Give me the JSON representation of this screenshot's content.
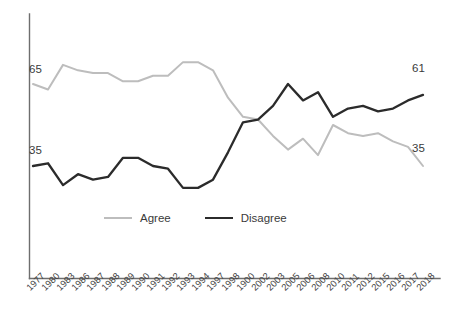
{
  "chart_data": {
    "type": "line",
    "title": "",
    "subtitle": "",
    "xlabel": "",
    "ylabel": "",
    "ylim": [
      0,
      100
    ],
    "grid": false,
    "legend_position": "bottom-center",
    "categories": [
      "1977",
      "1980",
      "1983",
      "1986",
      "1987",
      "1988",
      "1989",
      "1990",
      "1991",
      "1992",
      "1993",
      "1994",
      "1997",
      "1998",
      "1900",
      "2002",
      "2003",
      "2005",
      "2006",
      "2008",
      "2010",
      "2011",
      "2012",
      "2015",
      "2016",
      "2017",
      "2018"
    ],
    "series": [
      {
        "name": "Agree",
        "color": "#bdbdbd",
        "values": [
          65,
          63,
          72,
          70,
          69,
          69,
          66,
          66,
          68,
          68,
          73,
          73,
          70,
          60,
          53,
          52,
          46,
          41,
          45,
          39,
          50,
          47,
          46,
          47,
          44,
          42,
          35
        ]
      },
      {
        "name": "Disagree",
        "color": "#2b2b2b",
        "values": [
          35,
          36,
          28,
          32,
          30,
          31,
          38,
          38,
          35,
          34,
          27,
          27,
          30,
          40,
          51,
          52,
          57,
          65,
          59,
          62,
          53,
          56,
          57,
          55,
          56,
          59,
          61
        ]
      }
    ],
    "endpoint_labels": {
      "agree_start": "65",
      "agree_end": "35",
      "disagree_start": "35",
      "disagree_end": "61"
    }
  },
  "legend": {
    "items": [
      {
        "label": "Agree",
        "color": "#bdbdbd"
      },
      {
        "label": "Disagree",
        "color": "#2b2b2b"
      }
    ]
  },
  "axis": {
    "left_top_label": "65",
    "left_bottom_label": "35",
    "right_top_label": "61",
    "right_bottom_label": "35"
  }
}
